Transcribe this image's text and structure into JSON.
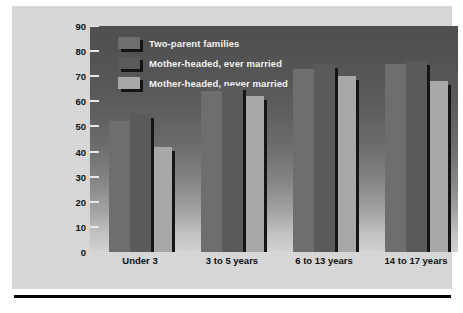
{
  "chart_data": {
    "type": "bar",
    "title": "",
    "xlabel": "",
    "ylabel": "Percentage of employed mothers",
    "ylim": [
      0,
      90
    ],
    "yticks": [
      0,
      10,
      20,
      30,
      40,
      50,
      60,
      70,
      80,
      90
    ],
    "grid": false,
    "legend_position": "top-left-inside",
    "categories": [
      "Under 3",
      "3 to 5 years",
      "6 to 13 years",
      "14 to 17 years"
    ],
    "series": [
      {
        "name": "Two-parent families",
        "values": [
          52,
          64,
          73,
          75
        ],
        "color": "#6e6e6e"
      },
      {
        "name": "Mother-headed, ever married",
        "values": [
          55,
          66,
          75,
          76
        ],
        "color": "#5a5a5a"
      },
      {
        "name": "Mother-headed, never married",
        "values": [
          42,
          62,
          70,
          68
        ],
        "color": "#a8a8a8"
      }
    ]
  },
  "legend": {
    "items": [
      {
        "label": "Two-parent families"
      },
      {
        "label": "Mother-headed, ever married"
      },
      {
        "label": "Mother-headed, never married"
      }
    ]
  },
  "colors": {
    "panel_background": "#d9d9d9",
    "plot_top": "#4f4f4f",
    "plot_bottom": "#d2d2d2",
    "bar_shadow": "#151515",
    "axis_text": "#111111",
    "legend_text": "#f2f2f2",
    "rule": "#000000"
  }
}
